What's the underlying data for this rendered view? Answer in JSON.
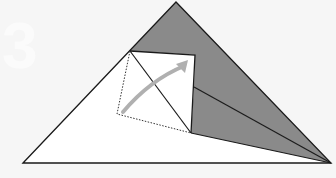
{
  "diagram": {
    "type": "origami-fold-step",
    "step_number": "3",
    "colors": {
      "background": "#f6f6f6",
      "paper_front": "#ffffff",
      "paper_back": "#8a8a8a",
      "line": "#1a1a1a",
      "arrow": "#b0b0b0"
    },
    "shapes": {
      "outer_triangle": "23,163 176,2 331,163",
      "gray_upper": "130,51 176,2 331,163 194,87 195,55",
      "gray_lower": "194,87 331,163 191,133",
      "white_square": "130,51 195,55 191,133 117,114",
      "fold_flap": "130,51 195,55 191,133"
    },
    "lines": {
      "crease_diagonal": "130,51 191,133",
      "edge_upper_right": "194,87 331,163",
      "edge_lower_right": "191,133 331,163",
      "dotted_guide": "130,51 117,114 191,133"
    },
    "arrow": {
      "path": "M123,112 Q150,80 184,66",
      "head": "188,60 176,64 185,73"
    }
  }
}
